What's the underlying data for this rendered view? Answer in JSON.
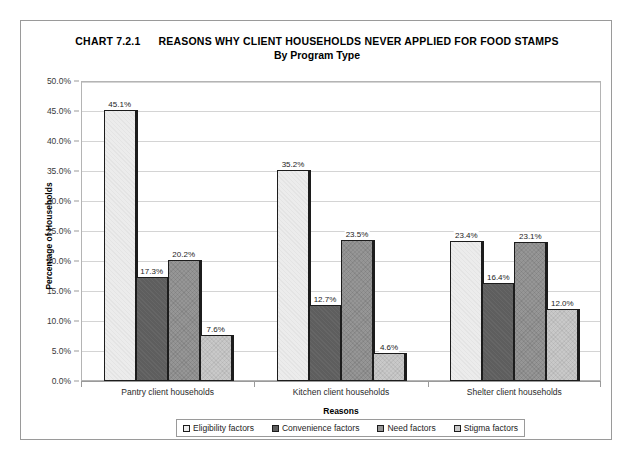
{
  "chart_data": {
    "type": "bar",
    "title_number": "CHART 7.2.1",
    "title_text": "REASONS WHY CLIENT HOUSEHOLDS NEVER APPLIED FOR FOOD STAMPS",
    "subtitle": "By Program Type",
    "xlabel": "Reasons",
    "ylabel": "Percentage of Households",
    "ylim": [
      0,
      50
    ],
    "ytick_step": 5,
    "ytick_labels": [
      "0.0%",
      "5.0%",
      "10.0%",
      "15.0%",
      "20.0%",
      "25.0%",
      "30.0%",
      "35.0%",
      "40.0%",
      "45.0%",
      "50.0%"
    ],
    "grid": true,
    "legend_position": "bottom",
    "categories": [
      "Pantry client households",
      "Kitchen client households",
      "Shelter client households"
    ],
    "series": [
      {
        "name": "Eligibility factors",
        "color": "#ececec",
        "values": [
          45.1,
          35.2,
          23.4
        ],
        "labels": [
          "45.1%",
          "35.2%",
          "23.4%"
        ]
      },
      {
        "name": "Convenience factors",
        "color": "#5e5e5e",
        "values": [
          17.3,
          12.7,
          16.4
        ],
        "labels": [
          "17.3%",
          "12.7%",
          "16.4%"
        ]
      },
      {
        "name": "Need factors",
        "color": "#969696",
        "values": [
          20.2,
          23.5,
          23.1
        ],
        "labels": [
          "20.2%",
          "23.5%",
          "23.1%"
        ]
      },
      {
        "name": "Stigma factors",
        "color": "#c9c9c9",
        "values": [
          7.6,
          4.6,
          12.0
        ],
        "labels": [
          "7.6%",
          "4.6%",
          "12.0%"
        ]
      }
    ]
  }
}
